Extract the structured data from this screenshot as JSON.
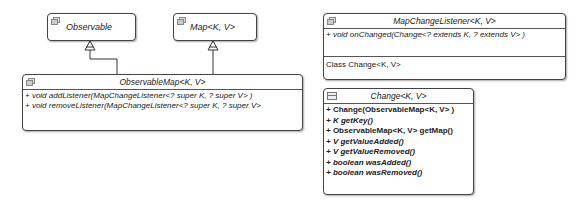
{
  "diagram": {
    "type": "uml-class",
    "classes": {
      "observable": {
        "name": "Observable",
        "stereotype": "interface"
      },
      "map": {
        "name": "Map<K, V>",
        "stereotype": "interface"
      },
      "observable_map": {
        "name": "ObservableMap<K, V>",
        "methods": [
          "+ void addListener(MapChangeListener<? super K, ? super V> )",
          "+ void removeListener(MapChangeListener<? super K, ? super V>"
        ]
      },
      "map_change_listener": {
        "name": "MapChangeListener<K, V>",
        "methods": [
          "+ void onChanged(Change<? extends K, ? extends V> )"
        ],
        "inner": [
          "Class Change<K, V>"
        ]
      },
      "change": {
        "name": "Change<K, V>",
        "methods": [
          "+ Change(ObservableMap<K, V> )",
          "+ K getKey()",
          "+ ObservableMap<K, V> getMap()",
          "+ V getValueAdded()",
          "+ V getValueRemoved()",
          "+ boolean wasAdded()",
          "+ boolean wasRemoved()"
        ]
      }
    },
    "relations": [
      {
        "from": "ObservableMap<K, V>",
        "to": "Observable",
        "type": "generalization"
      },
      {
        "from": "ObservableMap<K, V>",
        "to": "Map<K, V>",
        "type": "generalization"
      }
    ]
  }
}
